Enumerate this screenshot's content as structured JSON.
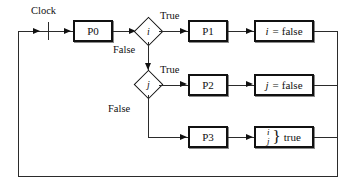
{
  "diagram": {
    "type": "flowchart",
    "clock_label": "Clock",
    "colors": {
      "line": "#2b2b2b",
      "box_border": "#111111",
      "background": "#ffffff"
    },
    "process_blocks": [
      {
        "id": "p0",
        "label": "P0"
      },
      {
        "id": "p1",
        "label": "P1"
      },
      {
        "id": "p2",
        "label": "P2"
      },
      {
        "id": "p3",
        "label": "P3"
      }
    ],
    "decisions": [
      {
        "id": "d_i",
        "condition": "i",
        "true_label": "True",
        "false_label": "False"
      },
      {
        "id": "d_j",
        "condition": "j",
        "true_label": "True",
        "false_label": "False"
      }
    ],
    "actions": [
      {
        "id": "a_i",
        "variable": "i",
        "operator": "=",
        "value": "false"
      },
      {
        "id": "a_j",
        "variable": "j",
        "operator": "=",
        "value": "false"
      },
      {
        "id": "a_ij",
        "variable_top": "i",
        "variable_bottom": "j",
        "brace": "}",
        "value": "true"
      }
    ]
  }
}
